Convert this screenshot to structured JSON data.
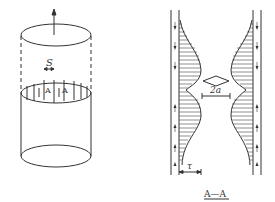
{
  "figure_left": {
    "title": "cylinder-with-slots",
    "spacing_label": "S",
    "slot_labels": [
      "A",
      "A"
    ],
    "stroke_color": "#333333"
  },
  "figure_right": {
    "section_label": "A—A",
    "width_label": "2a",
    "stress_label": "τ",
    "stroke_color": "#333333"
  }
}
